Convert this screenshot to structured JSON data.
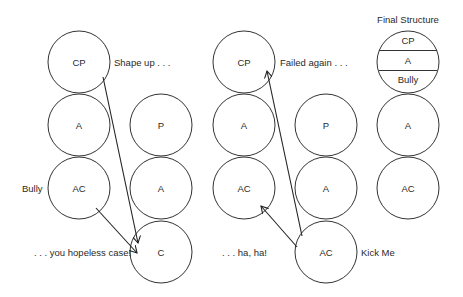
{
  "diagram": {
    "type": "transactional-analysis-ego-states",
    "left_group": {
      "person1": {
        "states": [
          "CP",
          "A",
          "AC"
        ],
        "side_labels": {
          "CP": "Shape up . . .",
          "AC": "Bully"
        }
      },
      "person2": {
        "states": [
          "P",
          "A",
          "C"
        ]
      },
      "caption": ". . . you hopeless case!",
      "arrows": [
        {
          "from": "person1.CP",
          "to": "person2.C"
        },
        {
          "from": "person1.AC",
          "to": "person2.C"
        }
      ]
    },
    "middle_group": {
      "person1": {
        "states": [
          "CP",
          "A",
          "AC"
        ],
        "side_labels": {
          "CP": "Failed again . . ."
        }
      },
      "person2": {
        "states": [
          "P",
          "A",
          "AC"
        ],
        "side_labels": {
          "AC": "Kick Me"
        }
      },
      "caption": ". . . ha, ha!",
      "arrows": [
        {
          "from": "person2.AC",
          "to": "person1.CP"
        },
        {
          "from": "person2.AC",
          "to": "person1.AC"
        }
      ]
    },
    "final_structure": {
      "title": "Final Structure",
      "top_circle_sections": [
        "CP",
        "A",
        "Bully"
      ],
      "states": [
        "A",
        "AC"
      ]
    }
  }
}
